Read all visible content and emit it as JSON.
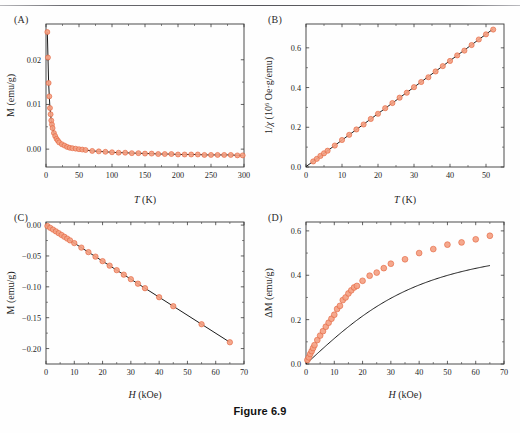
{
  "caption": "Figure 6.9",
  "panels": [
    {
      "label": "(A)",
      "xlabel_italic": "T",
      "xlabel_rest": " (K)",
      "ylabel": "M (emu/g)"
    },
    {
      "label": "(B)",
      "xlabel_italic": "T",
      "xlabel_rest": " (K)",
      "ylabel_prefix": "1/",
      "ylabel_chi": "χ",
      "ylabel_rest": " (10",
      "ylabel_exp": "6",
      "ylabel_units": " Oe·g/emu)"
    },
    {
      "label": "(C)",
      "xlabel_italic": "H",
      "xlabel_rest": " (kOe)",
      "ylabel": "M (emu/g)"
    },
    {
      "label": "(D)",
      "xlabel_italic": "H",
      "xlabel_rest": " (kOe)",
      "ylabel": "ΔM (emu/g)"
    }
  ],
  "colors": {
    "marker_fill": "#f4a183",
    "marker_stroke": "#e2613a",
    "fit_line": "#1a1a1a",
    "axis": "#3a3a3a"
  },
  "chart_data": [
    {
      "type": "scatter",
      "panel": "A",
      "title": "",
      "xlabel": "T (K)",
      "ylabel": "M (emu/g)",
      "xlim": [
        0,
        300
      ],
      "ylim": [
        -0.004,
        0.028
      ],
      "xticks": [
        0,
        50,
        100,
        150,
        200,
        250,
        300
      ],
      "yticks": [
        0.0,
        0.01,
        0.02
      ],
      "ytick_labels": [
        "0.00",
        "0.01",
        "0.02"
      ],
      "grid": false,
      "legend": "none",
      "series": [
        {
          "name": "M vs T",
          "x": [
            2,
            3,
            4,
            5,
            6,
            7,
            8,
            9,
            10,
            12,
            14,
            16,
            18,
            20,
            24,
            28,
            32,
            36,
            40,
            45,
            50,
            55,
            60,
            70,
            80,
            90,
            100,
            110,
            120,
            130,
            140,
            150,
            160,
            170,
            180,
            190,
            200,
            210,
            220,
            230,
            240,
            250,
            260,
            270,
            280,
            290,
            298
          ],
          "y": [
            0.0262,
            0.0205,
            0.0148,
            0.0118,
            0.0092,
            0.0078,
            0.0064,
            0.0055,
            0.0047,
            0.0036,
            0.0029,
            0.0023,
            0.0019,
            0.0015,
            0.0011,
            0.0008,
            0.0005,
            0.0003,
            0.0002,
            0.0001,
            -2e-05,
            -0.0001,
            -0.0002,
            -0.0004,
            -0.0005,
            -0.0006,
            -0.0007,
            -0.0008,
            -0.0008,
            -0.0009,
            -0.0009,
            -0.001,
            -0.001,
            -0.0011,
            -0.0011,
            -0.0011,
            -0.0012,
            -0.0012,
            -0.0012,
            -0.0012,
            -0.0013,
            -0.0013,
            -0.0013,
            -0.0013,
            -0.0013,
            -0.0014,
            -0.0014
          ]
        }
      ]
    },
    {
      "type": "scatter",
      "panel": "B",
      "title": "",
      "xlabel": "T (K)",
      "ylabel": "1/χ (10^6 Oe·g/emu)",
      "xlim": [
        0,
        55
      ],
      "ylim": [
        0,
        0.72
      ],
      "xticks": [
        0,
        10,
        20,
        30,
        40,
        50
      ],
      "yticks": [
        0.0,
        0.2,
        0.4,
        0.6
      ],
      "ytick_labels": [
        "0.0",
        "0.2",
        "0.4",
        "0.6"
      ],
      "grid": false,
      "legend": "none",
      "fit": {
        "type": "linear",
        "slope": 0.01333,
        "intercept": 0.002
      },
      "series": [
        {
          "name": "1/chi vs T",
          "x": [
            2,
            3,
            4,
            5,
            6,
            8,
            10,
            12,
            14,
            16,
            18,
            20,
            22,
            24,
            26,
            28,
            30,
            32,
            34,
            36,
            38,
            40,
            42,
            44,
            46,
            48,
            50,
            52
          ],
          "y": [
            0.028,
            0.041,
            0.056,
            0.069,
            0.082,
            0.108,
            0.136,
            0.162,
            0.189,
            0.214,
            0.242,
            0.268,
            0.296,
            0.322,
            0.349,
            0.374,
            0.402,
            0.428,
            0.452,
            0.481,
            0.508,
            0.534,
            0.562,
            0.586,
            0.614,
            0.642,
            0.668,
            0.692
          ]
        }
      ]
    },
    {
      "type": "scatter",
      "panel": "C",
      "title": "",
      "xlabel": "H (kOe)",
      "ylabel": "M (emu/g)",
      "xlim": [
        0,
        70
      ],
      "ylim": [
        -0.225,
        0.005
      ],
      "xticks": [
        0,
        10,
        20,
        30,
        40,
        50,
        60,
        70
      ],
      "yticks": [
        0.0,
        -0.05,
        -0.1,
        -0.15,
        -0.2
      ],
      "ytick_labels": [
        "0.00",
        "−0.05",
        "−0.10",
        "−0.15",
        "−0.20"
      ],
      "grid": false,
      "legend": "none",
      "fit": {
        "type": "linear",
        "slope": -0.00292,
        "intercept": 0.0
      },
      "series": [
        {
          "name": "M vs H",
          "x": [
            0.5,
            1.5,
            2.5,
            3.5,
            4.5,
            5.5,
            6.5,
            7.5,
            8.5,
            10,
            12.5,
            15,
            17.5,
            20,
            22.5,
            25,
            27.5,
            30,
            32.5,
            35,
            40,
            45,
            55,
            65
          ],
          "y": [
            -0.0015,
            -0.0045,
            -0.0073,
            -0.0102,
            -0.0131,
            -0.016,
            -0.019,
            -0.0219,
            -0.0248,
            -0.0292,
            -0.0365,
            -0.0438,
            -0.0511,
            -0.0584,
            -0.0657,
            -0.073,
            -0.0803,
            -0.0876,
            -0.0949,
            -0.1022,
            -0.1168,
            -0.1314,
            -0.1606,
            -0.1898
          ]
        }
      ]
    },
    {
      "type": "scatter",
      "panel": "D",
      "title": "",
      "xlabel": "H (kOe)",
      "ylabel": "ΔM (emu/g)",
      "xlim": [
        0,
        70
      ],
      "ylim": [
        0,
        0.64
      ],
      "xticks": [
        0,
        10,
        20,
        30,
        40,
        50,
        60,
        70
      ],
      "yticks": [
        0.0,
        0.2,
        0.4,
        0.6
      ],
      "ytick_labels": [
        "0.0",
        "0.2",
        "0.4",
        "0.6"
      ],
      "grid": false,
      "legend": "none",
      "fit": {
        "type": "langevin",
        "saturation": 0.6,
        "field_scale": 17.0
      },
      "series": [
        {
          "name": "dM vs H",
          "x": [
            0.5,
            1,
            1.5,
            2,
            2.5,
            3,
            4,
            5,
            6,
            7,
            8,
            9,
            10,
            11,
            12,
            13,
            14,
            15,
            16,
            17,
            18,
            20,
            22.5,
            25,
            27.5,
            30,
            35,
            40,
            45,
            50,
            55,
            60,
            65
          ],
          "y": [
            0.018,
            0.03,
            0.045,
            0.058,
            0.072,
            0.085,
            0.108,
            0.128,
            0.148,
            0.168,
            0.186,
            0.204,
            0.222,
            0.248,
            0.262,
            0.288,
            0.3,
            0.318,
            0.332,
            0.345,
            0.352,
            0.375,
            0.398,
            0.412,
            0.432,
            0.452,
            0.472,
            0.5,
            0.518,
            0.538,
            0.548,
            0.562,
            0.578
          ]
        }
      ]
    }
  ]
}
